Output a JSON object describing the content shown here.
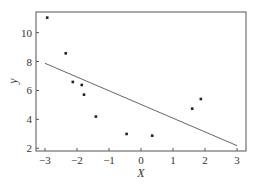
{
  "chart_data": {
    "type": "scatter",
    "title": "",
    "xlabel": "X",
    "ylabel": "y",
    "xlim": [
      -3.28,
      3.28
    ],
    "ylim": [
      1.81,
      11.43
    ],
    "xticks": [
      -3,
      -2,
      -1,
      0,
      1,
      2,
      3
    ],
    "yticks": [
      2,
      4,
      6,
      8,
      10
    ],
    "xtick_labels": [
      "−3",
      "−2",
      "−1",
      "0",
      "1",
      "2",
      "3"
    ],
    "ytick_labels": [
      "2",
      "4",
      "6",
      "8",
      "10"
    ],
    "grid": false,
    "legend": null,
    "series": [
      {
        "name": "data points",
        "kind": "scatter",
        "x": [
          -2.93,
          -2.35,
          -2.13,
          -1.85,
          -1.78,
          -1.41,
          -0.45,
          0.35,
          1.6,
          1.87
        ],
        "y": [
          11.04,
          8.57,
          6.59,
          6.38,
          5.71,
          4.19,
          2.99,
          2.87,
          4.74,
          5.41
        ]
      },
      {
        "name": "fitted line",
        "kind": "line",
        "x": [
          -3,
          3
        ],
        "y": [
          7.88,
          2.18
        ]
      }
    ]
  },
  "colors": {
    "axis": "#555555",
    "points": "#222222",
    "line": "#666666",
    "text": "#333333"
  }
}
